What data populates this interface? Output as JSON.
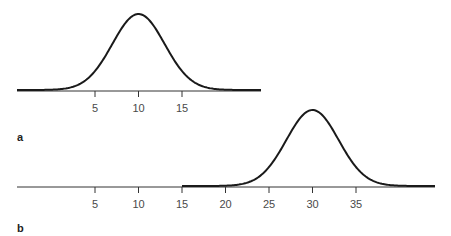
{
  "chart_data": [
    {
      "type": "line",
      "panel_label": "a",
      "title": "",
      "xlabel": "",
      "ylabel": "",
      "description": "Normal distribution curve centered at 10",
      "mean": 10,
      "sd": 3,
      "x_ticks": [
        5,
        10,
        15
      ],
      "x_tick_labels": [
        "5",
        "10",
        "15"
      ],
      "xlim": [
        -1,
        21
      ],
      "grid": false,
      "legend": null
    },
    {
      "type": "line",
      "panel_label": "b",
      "title": "",
      "xlabel": "",
      "ylabel": "",
      "description": "Normal distribution curve centered at 30, drawn from x = 15 onward",
      "mean": 30,
      "sd": 3,
      "curve_start_x": 15,
      "x_ticks": [
        5,
        10,
        15,
        20,
        25,
        30,
        35
      ],
      "x_tick_labels": [
        "5",
        "10",
        "15",
        "20",
        "25",
        "30",
        "35"
      ],
      "xlim": [
        -1,
        44
      ],
      "grid": false,
      "legend": null
    }
  ],
  "labels": {
    "panel_a": "a",
    "panel_b": "b"
  },
  "style": {
    "curve_color": "#1a1a1a",
    "axis_color": "#333333",
    "text_color": "#4a4a4a"
  }
}
